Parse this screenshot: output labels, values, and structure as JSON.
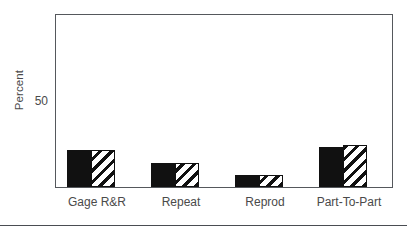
{
  "chart_data": {
    "type": "bar",
    "title": "",
    "subtitle": "",
    "xlabel": "",
    "ylabel": "Percent",
    "categories": [
      "Gage  R&R",
      "Repeat",
      "Reprod",
      "Part-To-Part"
    ],
    "series": [
      {
        "name": "%Contribution",
        "values": [
          22,
          14,
          7,
          24
        ]
      },
      {
        "name": "%Study Var",
        "values": [
          22,
          14,
          7,
          25
        ]
      }
    ],
    "ylim": [
      0,
      102
    ],
    "ytick_labels": [
      "50"
    ],
    "ytick_values": [
      50
    ],
    "grid": false,
    "legend": "none",
    "bar_styles": [
      "solid-black",
      "diagonal-hatch"
    ],
    "colors": {
      "bar_solid": "#111111",
      "bar_hatch_line": "#111111",
      "bar_hatch_background": "#ffffff",
      "axis": "#55585c",
      "text": "#4a4a4a",
      "plot_background": "#ffffff",
      "page_background": "#ffffff",
      "rule": "#4a4d52"
    },
    "annotations": []
  }
}
